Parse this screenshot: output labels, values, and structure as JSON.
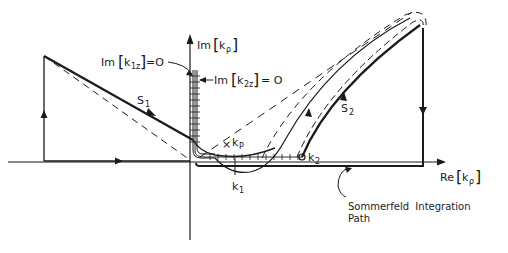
{
  "diagram": {
    "axes": {
      "imag_axis_label": "Im",
      "imag_axis_var": "k",
      "imag_axis_sub": "ρ",
      "real_axis_label": "Re",
      "real_axis_var": "k",
      "real_axis_sub": "ρ"
    },
    "branch_cuts": {
      "k1z_label": "Im",
      "k1z_var": "k",
      "k1z_sub": "1z",
      "k1z_eq": "=O",
      "k2z_label": "Im",
      "k2z_var": "k",
      "k2z_sub": "2z",
      "k2z_eq": "= O"
    },
    "points": {
      "kp_var": "k",
      "kp_sub": "P",
      "kp_marker": "×",
      "k1_var": "k",
      "k1_sub": "1",
      "k2_var": "k",
      "k2_sub": "2"
    },
    "paths": {
      "s1_var": "S",
      "s1_sub": "1",
      "s2_var": "S",
      "s2_sub": "2"
    },
    "annotation": {
      "line1": "Sommerfeld  Integration",
      "line2": "Path"
    },
    "colors": {
      "ink": "#1a1a1a",
      "background": "#ffffff"
    }
  }
}
